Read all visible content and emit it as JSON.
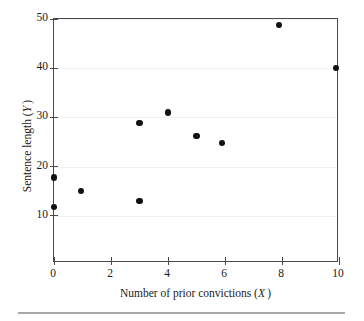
{
  "figure": {
    "axis_titles": {
      "x": "Number of prior convictions (X)",
      "x_text": "Number of prior convictions",
      "x_var": "X",
      "y": "Sentence length (Y)",
      "y_text": "Sentence length",
      "y_var": "Y"
    },
    "colors": {
      "point": "#111111",
      "axis": "#4a4a4a",
      "grid": "#f1f1f1",
      "rule": "#a8a8a8",
      "background": "#ffffff"
    }
  },
  "chart_data": {
    "type": "scatter",
    "title": "",
    "xlabel": "Number of prior convictions (X)",
    "ylabel": "Sentence length (Y)",
    "xlim": [
      0,
      10
    ],
    "ylim": [
      0.45,
      50
    ],
    "xticks": [
      0,
      2,
      4,
      6,
      8,
      10
    ],
    "xtick_labels": [
      "0",
      "2",
      "4",
      "6",
      "8",
      "10"
    ],
    "yticks": [
      10,
      20,
      30,
      40,
      50
    ],
    "ytick_labels": [
      "10",
      "20",
      "30",
      "40",
      "50"
    ],
    "grid": "horizontal-light",
    "legend": "none",
    "points": [
      {
        "x": 0,
        "y": 17.8
      },
      {
        "x": 0,
        "y": 11.9
      },
      {
        "x": 0.95,
        "y": 15.0
      },
      {
        "x": 3,
        "y": 28.8
      },
      {
        "x": 3,
        "y": 13.1
      },
      {
        "x": 4,
        "y": 31.0
      },
      {
        "x": 5,
        "y": 26.2
      },
      {
        "x": 5.9,
        "y": 24.9
      },
      {
        "x": 7.9,
        "y": 48.8
      },
      {
        "x": 9.9,
        "y": 40.0
      }
    ],
    "x": [
      0,
      0,
      0.95,
      3,
      3,
      4,
      5,
      5.9,
      7.9,
      9.9
    ],
    "values": [
      17.8,
      11.9,
      15.0,
      28.8,
      13.1,
      31.0,
      26.2,
      24.9,
      48.8,
      40.0
    ]
  }
}
